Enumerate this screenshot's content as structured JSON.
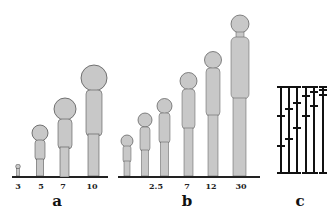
{
  "figure": {
    "panels": [
      {
        "id": "a",
        "label": "a",
        "ticks": [
          "3",
          "5",
          "7",
          "10"
        ],
        "figures": [
          {
            "tick": "3",
            "height": 12
          },
          {
            "tick": "5",
            "height": 52
          },
          {
            "tick": "7",
            "height": 80
          },
          {
            "tick": "10",
            "height": 112
          }
        ]
      },
      {
        "id": "b",
        "label": "b",
        "ticks": [
          "2.5",
          "7",
          "12",
          "30"
        ],
        "figures": [
          {
            "height": 42
          },
          {
            "height": 64
          },
          {
            "height": 78
          },
          {
            "height": 104
          },
          {
            "height": 125
          },
          {
            "height": 162
          }
        ]
      },
      {
        "id": "c",
        "label": "c",
        "rods": 6
      }
    ],
    "colors": {
      "body_fill": "#c8c8c8",
      "outline": "#555555",
      "ground": "#222222",
      "text": "#111111"
    }
  }
}
